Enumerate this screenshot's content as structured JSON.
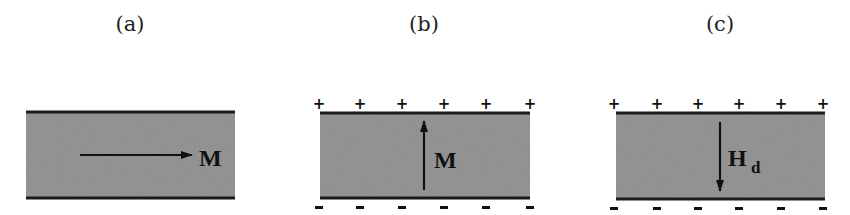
{
  "colors": {
    "film_fill": "#8d8d8d",
    "border": "#1a1a1a",
    "arrow": "#111111",
    "background": "#ffffff"
  },
  "panels": [
    {
      "id": "a",
      "label": "(a)",
      "vector_label": "M",
      "vector_subscript": "",
      "arrow_direction": "right",
      "surface_charges": false
    },
    {
      "id": "b",
      "label": "(b)",
      "vector_label": "M",
      "vector_subscript": "",
      "arrow_direction": "up",
      "surface_charges": true,
      "top_charges": [
        "+",
        "+",
        "+",
        "+",
        "+",
        "+"
      ],
      "bottom_charges": [
        "-",
        "-",
        "-",
        "-",
        "-",
        "-"
      ]
    },
    {
      "id": "c",
      "label": "(c)",
      "vector_label": "H",
      "vector_subscript": "d",
      "arrow_direction": "down",
      "surface_charges": true,
      "top_charges": [
        "+",
        "+",
        "+",
        "+",
        "+",
        "+"
      ],
      "bottom_charges": [
        "-",
        "-",
        "-",
        "-",
        "-",
        "-"
      ]
    }
  ]
}
